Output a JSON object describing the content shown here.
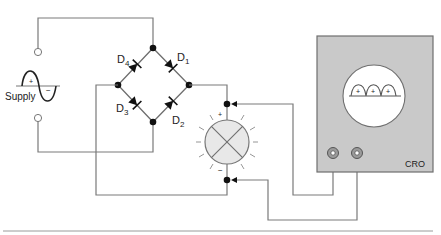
{
  "supply": {
    "label": "Supply",
    "plus": "+",
    "minus": "−"
  },
  "bridge": {
    "diodes": [
      {
        "id": "D1",
        "letter": "D",
        "sub": "1"
      },
      {
        "id": "D2",
        "letter": "D",
        "sub": "2"
      },
      {
        "id": "D3",
        "letter": "D",
        "sub": "3"
      },
      {
        "id": "D4",
        "letter": "D",
        "sub": "4"
      }
    ]
  },
  "lamp": {
    "plus": "+",
    "minus": "−"
  },
  "cro": {
    "label": "CRO",
    "waveform_marks": [
      "+",
      "+",
      "+"
    ]
  },
  "colors": {
    "wire": "#7a7a7a",
    "cro_body": "#c9c9c9",
    "cro_border": "#6f6f6f",
    "screen": "#ffffff",
    "lamp_fill": "#e8e8e8",
    "node": "#111111"
  }
}
